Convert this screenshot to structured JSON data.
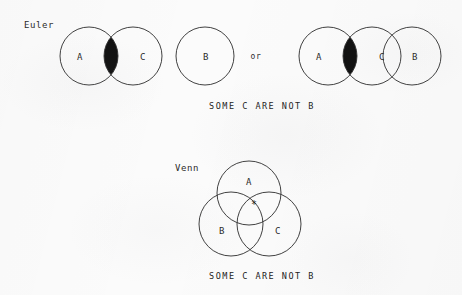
{
  "figure": {
    "background_color": "#fbfbfb",
    "ink_color": "#2b2b2b",
    "fill_color": "#111111"
  },
  "euler": {
    "label": "Euler",
    "caption": "SOME C ARE NOT B",
    "conjunction": "or",
    "variant_1": {
      "circles": [
        {
          "set": "A",
          "cx": 89,
          "cy": 56,
          "r": 29,
          "fill": "none"
        },
        {
          "set": "C",
          "cx": 133,
          "cy": 56,
          "r": 29,
          "fill": "none"
        }
      ],
      "shaded_region": "A-and-C-lens",
      "shaded_style": "solid-black"
    },
    "variant_1_extra": {
      "circles": [
        {
          "set": "B",
          "cx": 205,
          "cy": 56,
          "r": 29,
          "fill": "none"
        }
      ]
    },
    "variant_2": {
      "circles": [
        {
          "set": "A",
          "cx": 328,
          "cy": 56,
          "r": 29,
          "fill": "none"
        },
        {
          "set": "C",
          "cx": 372,
          "cy": 56,
          "r": 29,
          "fill": "none"
        },
        {
          "set": "B",
          "cx": 412,
          "cy": 56,
          "r": 29,
          "fill": "none"
        }
      ],
      "shaded_region": "A-and-C-lens",
      "shaded_style": "solid-black"
    }
  },
  "venn": {
    "label": "Venn",
    "caption": "SOME C ARE NOT B",
    "circles": [
      {
        "set": "A",
        "cx": 249,
        "cy": 193,
        "r": 32,
        "label_x": 249,
        "label_y": 182
      },
      {
        "set": "B",
        "cx": 231,
        "cy": 224,
        "r": 32,
        "label_x": 222,
        "label_y": 231
      },
      {
        "set": "C",
        "cx": 269,
        "cy": 224,
        "r": 32,
        "label_x": 278,
        "label_y": 231
      }
    ],
    "shaded_region": "A-and-B-not-C",
    "shaded_style": "crosshatch",
    "marker": {
      "symbol": "*",
      "region": "A-and-C-not-B",
      "x": 254,
      "y": 205
    }
  }
}
